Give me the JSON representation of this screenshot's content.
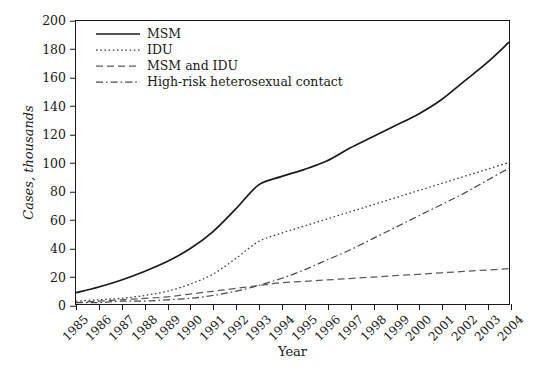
{
  "chart_data": {
    "type": "line",
    "title": "",
    "xlabel": "Year",
    "ylabel": "Cases, thousands",
    "x": [
      1985,
      1986,
      1987,
      1988,
      1989,
      1990,
      1991,
      1992,
      1993,
      1994,
      1995,
      1996,
      1997,
      1998,
      1999,
      2000,
      2001,
      2002,
      2003,
      2004
    ],
    "categories": [
      "1985",
      "1986",
      "1987",
      "1988",
      "1989",
      "1990",
      "1991",
      "1992",
      "1993",
      "1994",
      "1995",
      "1996",
      "1997",
      "1998",
      "1999",
      "2000",
      "2001",
      "2002",
      "2003",
      "2004"
    ],
    "xlim": [
      1985,
      2004
    ],
    "ylim": [
      0,
      200
    ],
    "yticks": [
      0,
      20,
      40,
      60,
      80,
      100,
      120,
      140,
      160,
      180,
      200
    ],
    "grid": false,
    "legend_position": "top-left",
    "series": [
      {
        "name": "MSM",
        "style": "solid",
        "color": "#1a1a1a",
        "values": [
          8,
          12,
          17,
          23,
          30,
          39,
          51,
          67,
          84,
          90,
          95,
          101,
          110,
          118,
          126,
          134,
          144,
          157,
          170,
          185
        ]
      },
      {
        "name": "IDU",
        "style": "dotted",
        "color": "#3a3a3a",
        "values": [
          2,
          3,
          4,
          6,
          9,
          14,
          21,
          32,
          44,
          50,
          55,
          60,
          65,
          70,
          75,
          80,
          85,
          90,
          95,
          100
        ]
      },
      {
        "name": "MSM and IDU",
        "style": "dashed",
        "color": "#5a5a5a",
        "values": [
          1,
          2,
          3,
          4,
          5,
          7,
          9,
          11,
          13,
          15,
          16,
          17,
          18,
          19,
          20,
          21,
          22,
          23,
          24,
          25
        ]
      },
      {
        "name": "High-risk heterosexual contact",
        "style": "dashdot",
        "color": "#4a4a4a",
        "values": [
          1,
          1,
          2,
          2,
          3,
          4,
          6,
          9,
          13,
          18,
          24,
          31,
          38,
          46,
          54,
          62,
          70,
          78,
          87,
          96
        ]
      }
    ]
  },
  "axes": {
    "y_label": "Cases, thousands",
    "x_label": "Year"
  },
  "legend": {
    "items": [
      {
        "label": "MSM",
        "style": "solid"
      },
      {
        "label": "IDU",
        "style": "dotted"
      },
      {
        "label": "MSM and IDU",
        "style": "dashed"
      },
      {
        "label": "High-risk heterosexual contact",
        "style": "dashdot"
      }
    ]
  },
  "colors": {
    "background": "#ffffff",
    "axis": "#1a1a1a",
    "text": "#1a1a1a"
  }
}
